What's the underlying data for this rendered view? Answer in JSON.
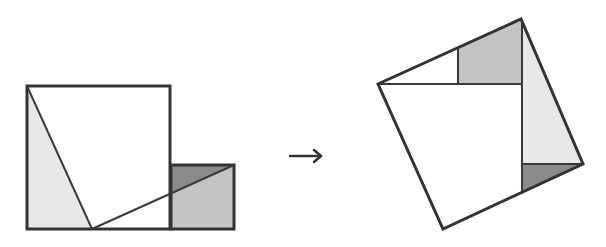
{
  "diagram": {
    "colors": {
      "background": "#ffffff",
      "stroke": "#333333",
      "light_gray": "#e8e8e8",
      "medium_gray": "#c4c4c4",
      "dark_gray": "#8a8a8a"
    },
    "left_figure": {
      "large_square": {
        "x": 27,
        "y": 86,
        "w": 143,
        "h": 143
      },
      "small_square": {
        "x": 171,
        "y": 165,
        "w": 63,
        "h": 64
      },
      "apex": {
        "x": 92,
        "y": 229
      },
      "regions": [
        {
          "name": "light-triangle",
          "fill": "light_gray",
          "points": "27,86 92,229 27,229"
        },
        {
          "name": "medium-region",
          "fill": "medium_gray",
          "points": "171,194 234,165 234,229 171,229"
        },
        {
          "name": "dark-triangle",
          "fill": "dark_gray",
          "points": "171,165 234,165 171,194"
        }
      ]
    },
    "arrow": {
      "symbol": "→",
      "x1": 290,
      "y1": 156,
      "x2": 322,
      "y2": 156
    },
    "right_figure": {
      "tilted_square": {
        "points": "378,84 521,19 583,164 443,229"
      },
      "regions": [
        {
          "name": "medium-region",
          "fill": "medium_gray",
          "points": "458,47 521,19 522,84 458,84"
        },
        {
          "name": "light-triangle",
          "fill": "light_gray",
          "points": "521,19 583,164 522,164"
        },
        {
          "name": "dark-triangle",
          "fill": "dark_gray",
          "points": "522,164 583,164 522,192"
        }
      ]
    }
  }
}
